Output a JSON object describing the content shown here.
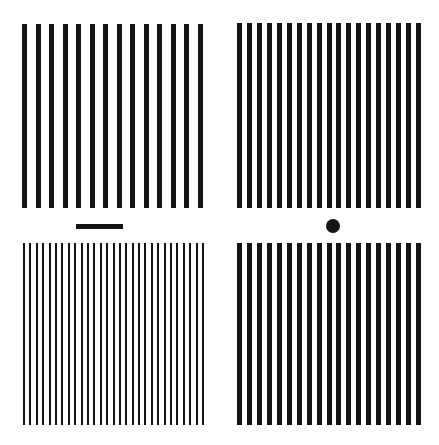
{
  "figure": {
    "background": "#ffffff",
    "ink": "#141414",
    "panels": [
      {
        "id": "top-left",
        "bars": 14,
        "x": 22,
        "y": 24,
        "width": 181,
        "height": 184,
        "bar_width": 5
      },
      {
        "id": "top-right",
        "bars": 19,
        "x": 237,
        "y": 23,
        "width": 184,
        "height": 185,
        "bar_width": 5
      },
      {
        "id": "bottom-left",
        "bars": 29,
        "x": 23,
        "y": 243,
        "width": 181,
        "height": 182,
        "bar_width": 2
      },
      {
        "id": "bottom-right",
        "bars": 19,
        "x": 237,
        "y": 243,
        "width": 184,
        "height": 182,
        "bar_width": 5
      }
    ],
    "markers": [
      {
        "id": "dash",
        "shape": "bar",
        "x": 76,
        "y": 224,
        "width": 47,
        "height": 5
      },
      {
        "id": "dot",
        "shape": "circle",
        "cx": 333,
        "cy": 226,
        "r": 7
      }
    ]
  }
}
